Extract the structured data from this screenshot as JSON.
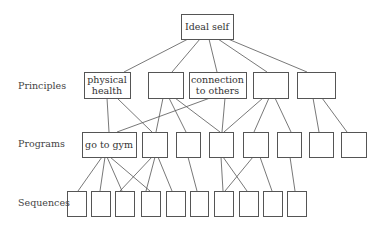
{
  "diagram": {
    "levels": [
      {
        "id": "principles",
        "label": "Principles",
        "x": 18,
        "y": 89
      },
      {
        "id": "programs",
        "label": "Programs",
        "x": 18,
        "y": 147
      },
      {
        "id": "sequences",
        "label": "Sequences",
        "x": 18,
        "y": 206
      }
    ],
    "nodes": {
      "root": {
        "label": "Ideal self",
        "x": 181,
        "y": 14,
        "w": 52,
        "h": 25
      },
      "principles": [
        {
          "label_lines": [
            "physical",
            "health"
          ],
          "x": 84,
          "y": 72,
          "w": 46,
          "h": 26
        },
        {
          "label_lines": [],
          "x": 148,
          "y": 72,
          "w": 35,
          "h": 26
        },
        {
          "label_lines": [
            "connection",
            "to others"
          ],
          "x": 189,
          "y": 72,
          "w": 57,
          "h": 26
        },
        {
          "label_lines": [],
          "x": 253,
          "y": 72,
          "w": 35,
          "h": 26
        },
        {
          "label_lines": [],
          "x": 297,
          "y": 72,
          "w": 38,
          "h": 26
        }
      ],
      "programs": [
        {
          "label_lines": [
            "go to gym"
          ],
          "x": 82,
          "y": 132,
          "w": 54,
          "h": 25
        },
        {
          "label_lines": [],
          "x": 142,
          "y": 132,
          "w": 25,
          "h": 25
        },
        {
          "label_lines": [],
          "x": 176,
          "y": 132,
          "w": 24,
          "h": 25
        },
        {
          "label_lines": [],
          "x": 209,
          "y": 132,
          "w": 24,
          "h": 25
        },
        {
          "label_lines": [],
          "x": 243,
          "y": 132,
          "w": 25,
          "h": 25
        },
        {
          "label_lines": [],
          "x": 277,
          "y": 132,
          "w": 24,
          "h": 25
        },
        {
          "label_lines": [],
          "x": 309,
          "y": 132,
          "w": 24,
          "h": 25
        },
        {
          "label_lines": [],
          "x": 341,
          "y": 132,
          "w": 25,
          "h": 25
        }
      ],
      "sequences": [
        {
          "x": 67,
          "y": 191,
          "w": 19,
          "h": 25
        },
        {
          "x": 91,
          "y": 191,
          "w": 19,
          "h": 25
        },
        {
          "x": 115,
          "y": 191,
          "w": 19,
          "h": 25
        },
        {
          "x": 141,
          "y": 191,
          "w": 19,
          "h": 25
        },
        {
          "x": 166,
          "y": 191,
          "w": 19,
          "h": 25
        },
        {
          "x": 190,
          "y": 191,
          "w": 18,
          "h": 25
        },
        {
          "x": 214,
          "y": 191,
          "w": 19,
          "h": 25
        },
        {
          "x": 239,
          "y": 191,
          "w": 19,
          "h": 25
        },
        {
          "x": 263,
          "y": 191,
          "w": 19,
          "h": 25
        },
        {
          "x": 287,
          "y": 191,
          "w": 19,
          "h": 25
        }
      ]
    },
    "edges": [
      {
        "from": "root",
        "to": "principles.0",
        "x1": 188,
        "y1": 39,
        "x2": 124,
        "y2": 72
      },
      {
        "from": "root",
        "to": "principles.1",
        "x1": 200,
        "y1": 39,
        "x2": 172,
        "y2": 72
      },
      {
        "from": "root",
        "to": "principles.2",
        "x1": 209,
        "y1": 39,
        "x2": 217,
        "y2": 72
      },
      {
        "from": "root",
        "to": "principles.3",
        "x1": 218,
        "y1": 39,
        "x2": 267,
        "y2": 72
      },
      {
        "from": "root",
        "to": "principles.4",
        "x1": 228,
        "y1": 39,
        "x2": 307,
        "y2": 72
      },
      {
        "from": "principles.0",
        "to": "programs.0",
        "x1": 107,
        "y1": 98,
        "x2": 109,
        "y2": 132
      },
      {
        "from": "principles.0",
        "to": "programs.1",
        "x1": 117,
        "y1": 98,
        "x2": 152,
        "y2": 132
      },
      {
        "from": "principles.2",
        "to": "programs.0",
        "x1": 210,
        "y1": 98,
        "x2": 117,
        "y2": 132
      },
      {
        "from": "principles.1",
        "to": "programs.1",
        "x1": 163,
        "y1": 98,
        "x2": 156,
        "y2": 132
      },
      {
        "from": "principles.1",
        "to": "programs.2",
        "x1": 169,
        "y1": 98,
        "x2": 186,
        "y2": 132
      },
      {
        "from": "principles.1",
        "to": "programs.3",
        "x1": 175,
        "y1": 98,
        "x2": 220,
        "y2": 132
      },
      {
        "from": "principles.2",
        "to": "programs.3",
        "x1": 225,
        "y1": 98,
        "x2": 222,
        "y2": 132
      },
      {
        "from": "principles.3",
        "to": "programs.3",
        "x1": 263,
        "y1": 98,
        "x2": 224,
        "y2": 132
      },
      {
        "from": "principles.3",
        "to": "programs.4",
        "x1": 269,
        "y1": 98,
        "x2": 254,
        "y2": 132
      },
      {
        "from": "principles.3",
        "to": "programs.5",
        "x1": 275,
        "y1": 98,
        "x2": 291,
        "y2": 132
      },
      {
        "from": "principles.4",
        "to": "programs.6",
        "x1": 313,
        "y1": 98,
        "x2": 319,
        "y2": 132
      },
      {
        "from": "principles.4",
        "to": "programs.7",
        "x1": 322,
        "y1": 98,
        "x2": 347,
        "y2": 132
      },
      {
        "from": "programs.0",
        "to": "sequences.0",
        "x1": 102,
        "y1": 157,
        "x2": 78,
        "y2": 191
      },
      {
        "from": "programs.0",
        "to": "sequences.1",
        "x1": 105,
        "y1": 157,
        "x2": 100,
        "y2": 191
      },
      {
        "from": "programs.0",
        "to": "sequences.2",
        "x1": 107,
        "y1": 157,
        "x2": 122,
        "y2": 191
      },
      {
        "from": "programs.0",
        "to": "sequences.3",
        "x1": 110,
        "y1": 157,
        "x2": 150,
        "y2": 191
      },
      {
        "from": "programs.1",
        "to": "sequences.2",
        "x1": 152,
        "y1": 157,
        "x2": 120,
        "y2": 191
      },
      {
        "from": "programs.1",
        "to": "sequences.3",
        "x1": 155,
        "y1": 157,
        "x2": 146,
        "y2": 191
      },
      {
        "from": "programs.1",
        "to": "sequences.4",
        "x1": 158,
        "y1": 157,
        "x2": 172,
        "y2": 191
      },
      {
        "from": "programs.2",
        "to": "sequences.5",
        "x1": 188,
        "y1": 157,
        "x2": 197,
        "y2": 191
      },
      {
        "from": "programs.3",
        "to": "sequences.6",
        "x1": 221,
        "y1": 157,
        "x2": 223,
        "y2": 191
      },
      {
        "from": "programs.3",
        "to": "sequences.7",
        "x1": 223,
        "y1": 157,
        "x2": 247,
        "y2": 191
      },
      {
        "from": "programs.4",
        "to": "sequences.6",
        "x1": 253,
        "y1": 157,
        "x2": 225,
        "y2": 191
      },
      {
        "from": "programs.4",
        "to": "sequences.8",
        "x1": 260,
        "y1": 157,
        "x2": 272,
        "y2": 191
      },
      {
        "from": "programs.5",
        "to": "sequences.9",
        "x1": 290,
        "y1": 157,
        "x2": 295,
        "y2": 191
      }
    ]
  }
}
